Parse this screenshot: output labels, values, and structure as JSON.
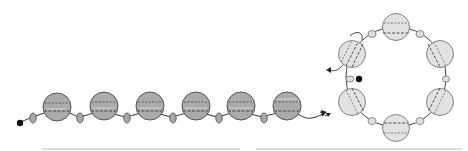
{
  "diagram": {
    "title": "Bead stringing steps",
    "colors": {
      "background": "#ffffff",
      "bead_large_left": "#ababab",
      "bead_large_right": "#e2e2e2",
      "bead_small_left": "#a9a9a9",
      "bead_small_right": "#dedede",
      "outline": "#555555",
      "thread": "#333333",
      "stop_bead": "#111111",
      "baseline": "#b8b8b8"
    },
    "panels": [
      {
        "id": "straight-strand",
        "description": "Strand of 6 large beads alternating with small beads, black stop bead at start, arrow at end",
        "large_bead_count": 6,
        "small_bead_count": 6,
        "stop_bead": true,
        "end_arrow": true
      },
      {
        "id": "ring",
        "description": "Strand joined into a ring of 6 large beads and 6 small beads, thread passes back through first bead",
        "large_bead_count": 6,
        "small_bead_count": 6,
        "stop_bead": true,
        "end_arrow": true
      }
    ]
  }
}
